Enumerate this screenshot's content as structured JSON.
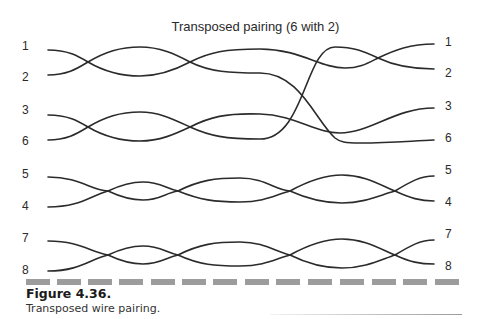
{
  "figure": {
    "title": "Transposed pairing (6 with 2)",
    "caption_title": "Figure 4.36.",
    "caption_text": "Transposed wire pairing."
  },
  "left_labels": [
    {
      "label": "1",
      "y": 40
    },
    {
      "label": "2",
      "y": 71
    },
    {
      "label": "3",
      "y": 104
    },
    {
      "label": "6",
      "y": 135
    },
    {
      "label": "5",
      "y": 168
    },
    {
      "label": "4",
      "y": 200
    },
    {
      "label": "7",
      "y": 232
    },
    {
      "label": "8",
      "y": 264
    }
  ],
  "right_labels": [
    {
      "label": "1",
      "y": 36
    },
    {
      "label": "2",
      "y": 67
    },
    {
      "label": "3",
      "y": 100
    },
    {
      "label": "6",
      "y": 132
    },
    {
      "label": "5",
      "y": 164
    },
    {
      "label": "4",
      "y": 196
    },
    {
      "label": "7",
      "y": 228
    },
    {
      "label": "8",
      "y": 260
    }
  ],
  "colors": {
    "wire": "#2b2b2b",
    "dash": "#9c9c9c",
    "text": "#2a2a2a"
  }
}
